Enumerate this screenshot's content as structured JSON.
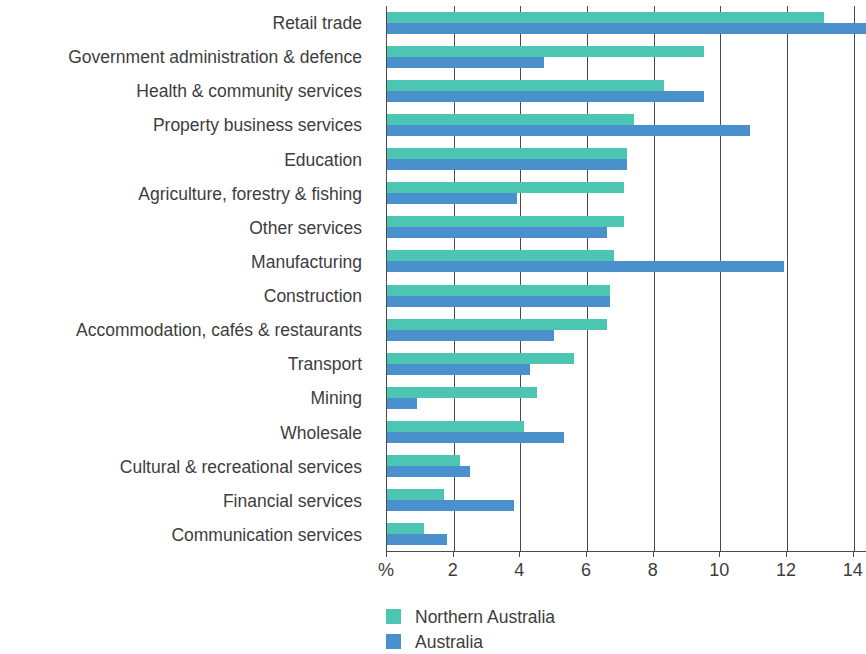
{
  "chart_data": {
    "type": "bar",
    "orientation": "horizontal",
    "title": "",
    "subtitle": "",
    "xlabel": "%",
    "ylabel": "",
    "xlim": [
      0,
      14.4
    ],
    "xticks": [
      0,
      2,
      4,
      6,
      8,
      10,
      12,
      14
    ],
    "xtick_labels": [
      "%",
      "2",
      "4",
      "6",
      "8",
      "10",
      "12",
      "14"
    ],
    "grid": true,
    "grid_axis": "x",
    "legend_position": "bottom-left",
    "categories": [
      "Retail trade",
      "Government administration & defence",
      "Health & community services",
      "Property business services",
      "Education",
      "Agriculture, forestry & fishing",
      "Other services",
      "Manufacturing",
      "Construction",
      "Accommodation, cafés & restaurants",
      "Transport",
      "Mining",
      "Wholesale",
      "Cultural & recreational services",
      "Financial services",
      "Communication services"
    ],
    "series": [
      {
        "name": "Northern Australia",
        "color": "#4CC6B2",
        "values": [
          13.1,
          9.5,
          8.3,
          7.4,
          7.2,
          7.1,
          7.1,
          6.8,
          6.7,
          6.6,
          5.6,
          4.5,
          4.1,
          2.2,
          1.7,
          1.1
        ]
      },
      {
        "name": "Australia",
        "color": "#4A90CC",
        "values": [
          14.4,
          4.7,
          9.5,
          10.9,
          7.2,
          3.9,
          6.6,
          11.9,
          6.7,
          5.0,
          4.3,
          0.9,
          5.3,
          2.5,
          3.8,
          1.8
        ]
      }
    ]
  },
  "legend": {
    "items": [
      {
        "label": "Northern Australia",
        "color": "#4CC6B2"
      },
      {
        "label": "Australia",
        "color": "#4A90CC"
      }
    ]
  }
}
